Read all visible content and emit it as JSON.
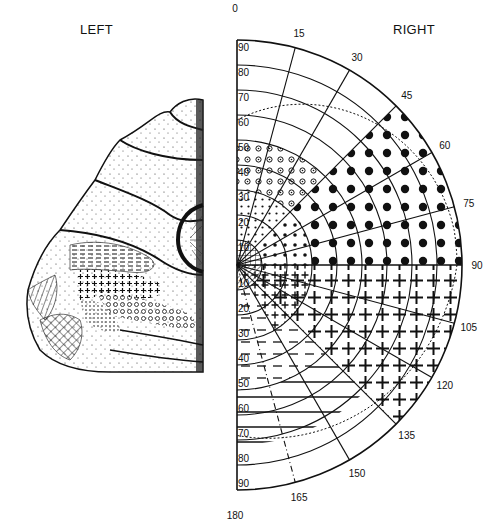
{
  "figure": {
    "left_label": "LEFT",
    "right_label": "RIGHT"
  },
  "chart_data": {
    "type": "polar-perimetry-map",
    "title": "",
    "left_panel": "Medial view of left occipital cortex with patterned retinotopic regions",
    "right_panel": "Right visual hemifield polar map (perimetry chart)",
    "eccentricity_rings_deg": [
      10,
      20,
      30,
      40,
      50,
      60,
      70,
      80,
      90
    ],
    "upper_eccentricity_labels": [
      "90",
      "80",
      "70",
      "60",
      "50",
      "40",
      "30",
      "20",
      "10"
    ],
    "lower_eccentricity_labels": [
      "10",
      "20",
      "30",
      "40",
      "50",
      "60",
      "70",
      "80",
      "90"
    ],
    "meridian_labels": [
      "0",
      "15",
      "30",
      "45",
      "60",
      "75",
      "90",
      "105",
      "120",
      "135",
      "150",
      "165",
      "180"
    ],
    "regions": [
      {
        "pattern": "grid (crosshatch)",
        "zone": "upper central 0-10 deg"
      },
      {
        "pattern": "diagonal hatch",
        "zone": "lower central 0-10 deg"
      },
      {
        "pattern": "small dots",
        "zone": "upper 10-30 deg"
      },
      {
        "pattern": "open circles",
        "zone": "upper 30-50 deg, near vertical meridian"
      },
      {
        "pattern": "large filled dots",
        "zone": "upper peripheral 45-90 meridians, 30-90 deg"
      },
      {
        "pattern": "plus signs",
        "zone": "lower quadrant 90-135 meridians"
      },
      {
        "pattern": "dashed lines",
        "zone": "lower 15-50 deg near vertical meridian"
      },
      {
        "pattern": "solid horizontal lines",
        "zone": "lower 50-70 deg"
      }
    ],
    "dotted_boundary": "approximate extent of field (~60 deg upper, ~70 deg lower)"
  }
}
